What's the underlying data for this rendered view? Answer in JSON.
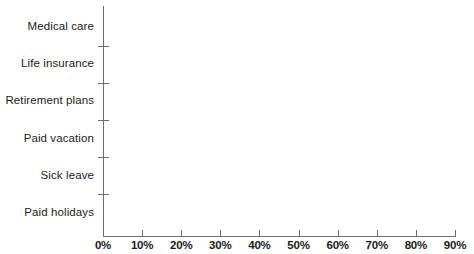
{
  "chart_data": {
    "type": "bar",
    "orientation": "horizontal",
    "title": "",
    "subtitle": "",
    "xlabel": "",
    "ylabel": "",
    "xlim": [
      0,
      90
    ],
    "grid": false,
    "legend": false,
    "legend_position": "none",
    "tick_suffix": "%",
    "categories": [
      "Medical care",
      "Life insurance",
      "Retirement plans",
      "Paid vacation",
      "Sick leave",
      "Paid holidays"
    ],
    "values": [
      88,
      76,
      78,
      86,
      78,
      88
    ],
    "xticks": [
      0,
      10,
      20,
      30,
      40,
      50,
      60,
      70,
      80,
      90
    ],
    "xtick_labels": [
      "0%",
      "10%",
      "20%",
      "30%",
      "40%",
      "50%",
      "60%",
      "70%",
      "80%",
      "90%"
    ],
    "series": [
      {
        "name": "Percent of workers with access",
        "values": [
          88,
          76,
          78,
          86,
          78,
          88
        ]
      }
    ],
    "colors": {
      "bar_fill": "#b0b0b0",
      "bar_highlight": "#c2c2c2",
      "bar_shadow": "#ababab",
      "axis": "#6e6e6e",
      "text": "#1b1b1b",
      "background": "#ffffff"
    }
  }
}
